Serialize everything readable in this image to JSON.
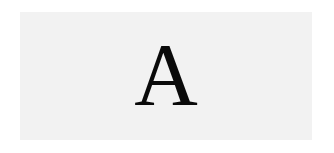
{
  "card": {
    "letter": "A",
    "background": "#f2f2f2",
    "text_color": "#0a0a0a"
  }
}
